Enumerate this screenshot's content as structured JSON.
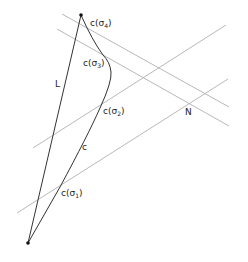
{
  "diagram": {
    "labels": {
      "L": "L",
      "c": "c",
      "N": "N",
      "c_sigma1_prefix": "c(",
      "c_sigma1_sym": "σ",
      "c_sigma1_sub": "1",
      "c_sigma1_suffix": ")",
      "c_sigma2_prefix": "c(",
      "c_sigma2_sym": "σ",
      "c_sigma2_sub": "2",
      "c_sigma2_suffix": ")",
      "c_sigma3_prefix": "c(",
      "c_sigma3_sym": "σ",
      "c_sigma3_sub": "3",
      "c_sigma3_suffix": ")",
      "c_sigma4_prefix": "c(",
      "c_sigma4_sym": "σ",
      "c_sigma4_sub": "4",
      "c_sigma4_suffix": ")"
    },
    "colors": {
      "main_stroke": "#333333",
      "grid_stroke": "#b0b0b0",
      "point_fill": "#111111"
    }
  }
}
